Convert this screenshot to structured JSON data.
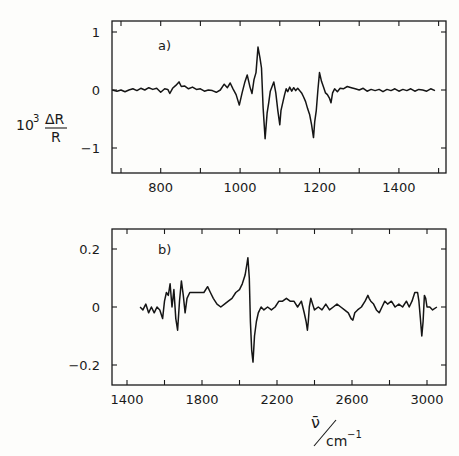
{
  "ylabel": {
    "prefix": "10",
    "exponent": "3",
    "numerator": "ΔR",
    "denominator": "R"
  },
  "xlabel": {
    "symbol": "ν̄",
    "unit": "cm",
    "unit_exponent": "−1"
  },
  "chart_data": [
    {
      "type": "line",
      "panel_label": "a)",
      "xlabel": "ν̄ / cm⁻¹",
      "ylabel": "10³ ΔR/R",
      "xlim": [
        675,
        1520
      ],
      "ylim": [
        -1.4,
        1.2
      ],
      "xticks": [
        700,
        800,
        900,
        1000,
        1100,
        1200,
        1300,
        1400,
        1500
      ],
      "xtick_labels": [
        "",
        "800",
        "",
        "1000",
        "",
        "1200",
        "",
        "1400",
        ""
      ],
      "yticks": [
        1,
        0,
        -1
      ],
      "ytick_labels": [
        "1",
        "0",
        "−1"
      ],
      "grid": false,
      "series": [
        {
          "name": "spectrum a",
          "x": [
            678,
            690,
            700,
            710,
            720,
            730,
            740,
            750,
            760,
            770,
            780,
            790,
            800,
            810,
            818,
            823,
            830,
            838,
            846,
            852,
            860,
            870,
            880,
            890,
            900,
            910,
            920,
            930,
            940,
            950,
            960,
            968,
            975,
            982,
            990,
            998,
            1005,
            1012,
            1018,
            1025,
            1030,
            1035,
            1040,
            1045,
            1050,
            1054,
            1058,
            1063,
            1068,
            1072,
            1076,
            1080,
            1085,
            1090,
            1095,
            1100,
            1103,
            1108,
            1112,
            1116,
            1120,
            1125,
            1130,
            1135,
            1140,
            1145,
            1150,
            1155,
            1160,
            1165,
            1170,
            1175,
            1180,
            1185,
            1188,
            1192,
            1196,
            1200,
            1205,
            1210,
            1215,
            1220,
            1225,
            1229,
            1233,
            1238,
            1245,
            1252,
            1260,
            1270,
            1280,
            1290,
            1300,
            1310,
            1320,
            1330,
            1340,
            1350,
            1360,
            1370,
            1380,
            1390,
            1400,
            1410,
            1420,
            1430,
            1440,
            1450,
            1460,
            1470,
            1480,
            1491
          ],
          "y": [
            0.0,
            -0.02,
            0.0,
            -0.03,
            0.0,
            0.02,
            -0.01,
            0.03,
            0.0,
            0.04,
            0.01,
            0.03,
            -0.04,
            0.02,
            0.01,
            -0.06,
            0.03,
            0.08,
            0.14,
            0.06,
            0.07,
            0.02,
            0.05,
            0.01,
            0.02,
            -0.02,
            0.0,
            -0.01,
            -0.04,
            0.0,
            0.1,
            0.04,
            0.12,
            0.02,
            -0.08,
            -0.26,
            -0.05,
            0.14,
            0.26,
            0.05,
            -0.06,
            0.18,
            0.3,
            0.74,
            0.55,
            0.38,
            -0.3,
            -0.84,
            -0.4,
            -0.22,
            -0.02,
            0.05,
            0.14,
            -0.05,
            -0.35,
            -0.6,
            -0.35,
            -0.2,
            -0.08,
            0.02,
            -0.03,
            0.05,
            -0.02,
            0.04,
            -0.01,
            0.03,
            -0.01,
            -0.05,
            -0.12,
            -0.2,
            -0.32,
            -0.42,
            -0.6,
            -0.82,
            -0.55,
            -0.35,
            0.0,
            0.3,
            0.15,
            0.05,
            -0.05,
            -0.08,
            -0.14,
            -0.22,
            -0.05,
            0.02,
            -0.03,
            0.03,
            0.02,
            0.06,
            0.04,
            0.02,
            0.0,
            0.03,
            -0.02,
            0.01,
            -0.01,
            0.01,
            -0.03,
            0.01,
            -0.01,
            0.02,
            -0.02,
            0.01,
            -0.01,
            0.02,
            -0.02,
            0.01,
            0.0,
            -0.02,
            0.02,
            -0.01,
            -0.02
          ]
        }
      ]
    },
    {
      "type": "line",
      "panel_label": "b)",
      "xlabel": "ν̄ / cm⁻¹",
      "ylabel": "10³ ΔR/R",
      "xlim": [
        1330,
        3110
      ],
      "ylim": [
        -0.27,
        0.27
      ],
      "xticks": [
        1400,
        1600,
        1800,
        2000,
        2200,
        2400,
        2600,
        2800,
        3000
      ],
      "xtick_labels": [
        "1400",
        "",
        "1800",
        "",
        "2200",
        "",
        "2600",
        "",
        "3000"
      ],
      "yticks": [
        0.2,
        0,
        -0.2
      ],
      "ytick_labels": [
        "0.2",
        "0",
        "−0.2"
      ],
      "grid": false,
      "series": [
        {
          "name": "spectrum b",
          "x": [
            1470,
            1485,
            1500,
            1515,
            1530,
            1545,
            1560,
            1575,
            1590,
            1600,
            1610,
            1620,
            1630,
            1640,
            1650,
            1660,
            1670,
            1680,
            1690,
            1700,
            1710,
            1720,
            1735,
            1750,
            1770,
            1790,
            1810,
            1830,
            1845,
            1860,
            1880,
            1900,
            1920,
            1940,
            1960,
            1980,
            2000,
            2015,
            2030,
            2040,
            2045,
            2052,
            2058,
            2065,
            2072,
            2080,
            2090,
            2100,
            2115,
            2130,
            2150,
            2170,
            2190,
            2210,
            2230,
            2250,
            2270,
            2290,
            2310,
            2330,
            2345,
            2355,
            2362,
            2367,
            2372,
            2380,
            2390,
            2400,
            2420,
            2440,
            2460,
            2480,
            2500,
            2520,
            2540,
            2560,
            2580,
            2595,
            2605,
            2615,
            2630,
            2650,
            2670,
            2685,
            2691,
            2700,
            2715,
            2730,
            2745,
            2760,
            2775,
            2790,
            2810,
            2830,
            2850,
            2870,
            2890,
            2905,
            2920,
            2935,
            2950,
            2957,
            2965,
            2972,
            2979,
            2986,
            2993,
            3000,
            3015,
            3030,
            3053
          ],
          "y": [
            0.0,
            -0.01,
            0.01,
            -0.02,
            0.0,
            -0.02,
            0.0,
            -0.01,
            -0.04,
            0.02,
            0.05,
            0.04,
            0.08,
            0.0,
            0.06,
            -0.04,
            -0.08,
            0.02,
            0.09,
            0.04,
            -0.02,
            0.03,
            0.05,
            0.05,
            0.05,
            0.05,
            0.05,
            0.07,
            0.05,
            0.03,
            0.01,
            0.0,
            0.01,
            0.02,
            0.03,
            0.05,
            0.06,
            0.08,
            0.11,
            0.15,
            0.17,
            0.1,
            -0.05,
            -0.15,
            -0.19,
            -0.1,
            -0.05,
            -0.02,
            0.0,
            -0.01,
            0.0,
            -0.01,
            0.0,
            0.02,
            0.02,
            0.03,
            0.02,
            0.02,
            0.0,
            0.02,
            -0.02,
            -0.05,
            -0.08,
            -0.05,
            0.0,
            0.03,
            0.01,
            -0.01,
            0.0,
            -0.01,
            0.01,
            -0.01,
            0.0,
            0.01,
            0.0,
            -0.01,
            -0.02,
            -0.04,
            -0.045,
            -0.02,
            -0.01,
            0.0,
            0.02,
            0.04,
            0.03,
            0.02,
            0.01,
            -0.01,
            -0.02,
            0.0,
            0.02,
            0.01,
            0.02,
            0.0,
            0.01,
            0.0,
            0.02,
            0.0,
            0.02,
            0.05,
            0.05,
            0.02,
            -0.04,
            -0.1,
            -0.05,
            0.04,
            0.03,
            0.0,
            0.0,
            -0.01,
            0.0
          ]
        }
      ]
    }
  ]
}
